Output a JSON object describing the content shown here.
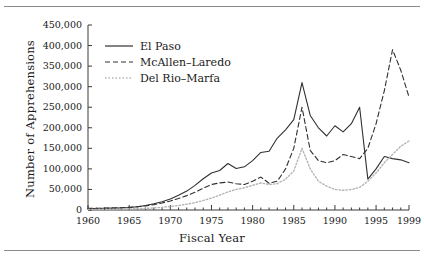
{
  "chart_data": {
    "type": "line",
    "title": "",
    "xlabel": "Fiscal Year",
    "ylabel": "Number of Apprehensions",
    "xlim": [
      1960,
      1999
    ],
    "ylim": [
      0,
      450000
    ],
    "grid": false,
    "legend_position": "top-left-inside",
    "y_ticks": [
      0,
      50000,
      100000,
      150000,
      200000,
      250000,
      300000,
      350000,
      400000,
      450000
    ],
    "y_tick_labels": [
      "0",
      "50,000",
      "100,000",
      "150,000",
      "200,000",
      "250,000",
      "300,000",
      "350,000",
      "400,000",
      "450,000"
    ],
    "x_ticks": [
      1960,
      1965,
      1970,
      1975,
      1980,
      1985,
      1990,
      1995,
      1999
    ],
    "x_tick_labels": [
      "1960",
      "1965",
      "1970",
      "1975",
      "1980",
      "1985",
      "1990",
      "1995",
      "1999"
    ],
    "x_minor_tick_interval": 1,
    "x": [
      1960,
      1961,
      1962,
      1963,
      1964,
      1965,
      1966,
      1967,
      1968,
      1969,
      1970,
      1971,
      1972,
      1973,
      1974,
      1975,
      1976,
      1977,
      1978,
      1979,
      1980,
      1981,
      1982,
      1983,
      1984,
      1985,
      1986,
      1987,
      1988,
      1989,
      1990,
      1991,
      1992,
      1993,
      1994,
      1995,
      1996,
      1997,
      1998,
      1999
    ],
    "series": [
      {
        "name": "El Paso",
        "style": "solid",
        "color": "#303030",
        "values": [
          3000,
          3500,
          4000,
          4500,
          5000,
          6000,
          8000,
          11000,
          15000,
          20000,
          27000,
          36000,
          46000,
          60000,
          76000,
          90000,
          96000,
          113000,
          101000,
          105000,
          120000,
          140000,
          143000,
          175000,
          195000,
          220000,
          310000,
          230000,
          200000,
          180000,
          205000,
          190000,
          210000,
          250000,
          75000,
          100000,
          130000,
          125000,
          122000,
          115000
        ]
      },
      {
        "name": "McAllen–Laredo",
        "style": "dashed",
        "color": "#303030",
        "values": [
          4000,
          4200,
          4500,
          5000,
          5500,
          6500,
          8000,
          10000,
          13000,
          17000,
          22000,
          28000,
          35000,
          43000,
          53000,
          62000,
          66000,
          68000,
          64000,
          62000,
          70000,
          80000,
          65000,
          70000,
          100000,
          150000,
          250000,
          145000,
          120000,
          115000,
          120000,
          135000,
          130000,
          125000,
          150000,
          210000,
          290000,
          390000,
          340000,
          275000
        ]
      },
      {
        "name": "Del Rio–Marfa",
        "style": "dotted",
        "color": "#b5b5b5",
        "values": [
          1500,
          1600,
          1800,
          2000,
          2200,
          2600,
          3200,
          4000,
          5000,
          6500,
          8500,
          11000,
          14000,
          18000,
          23000,
          29000,
          36000,
          44000,
          50000,
          54000,
          60000,
          66000,
          62000,
          64000,
          75000,
          95000,
          150000,
          100000,
          70000,
          58000,
          50000,
          48000,
          50000,
          55000,
          70000,
          90000,
          115000,
          135000,
          155000,
          168000
        ]
      }
    ]
  },
  "legend": {
    "items": [
      {
        "label": "El Paso",
        "key": "solid-line-key"
      },
      {
        "label": "McAllen–Laredo",
        "key": "dashed-line-key"
      },
      {
        "label": "Del Rio–Marfa",
        "key": "dotted-line-key"
      }
    ]
  }
}
